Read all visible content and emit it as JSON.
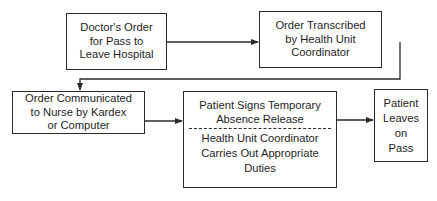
{
  "diagram": {
    "type": "flowchart",
    "nodes": [
      {
        "id": "doctors-order",
        "lines": [
          "Doctor's Order",
          "for Pass to",
          "Leave Hospital"
        ]
      },
      {
        "id": "order-transcribed",
        "lines": [
          "Order Transcribed",
          "by Health Unit",
          "Coordinator"
        ]
      },
      {
        "id": "order-communicated",
        "lines": [
          "Order Communicated",
          "to Nurse by Kardex",
          "or Computer"
        ]
      },
      {
        "id": "patient-signs",
        "top_lines": [
          "Patient Signs Temporary",
          "Absence Release"
        ],
        "bottom_lines": [
          "Health Unit Coordinator",
          "Carries Out Appropriate",
          "Duties"
        ]
      },
      {
        "id": "patient-leaves",
        "lines": [
          "Patient",
          "Leaves",
          "on",
          "Pass"
        ]
      }
    ],
    "edges": [
      {
        "from": "doctors-order",
        "to": "order-transcribed"
      },
      {
        "from": "order-transcribed",
        "to": "order-communicated"
      },
      {
        "from": "order-communicated",
        "to": "patient-signs"
      },
      {
        "from": "patient-signs",
        "to": "patient-leaves"
      }
    ]
  },
  "colors": {
    "line": "#2a2a2a",
    "background": "#ffffff"
  }
}
